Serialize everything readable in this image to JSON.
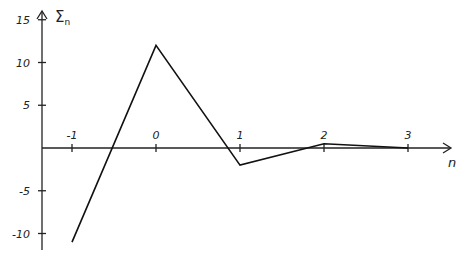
{
  "chart_data": {
    "type": "line",
    "title": "",
    "xlabel": "n",
    "ylabel": "Σ_n",
    "x": [
      -1,
      0,
      1,
      2,
      3
    ],
    "series": [
      {
        "name": "Σ_n",
        "values": [
          -11,
          12,
          -2,
          0.5,
          0
        ]
      }
    ],
    "x_ticks": [
      "-1",
      "0",
      "1",
      "2",
      "3"
    ],
    "y_ticks": [
      "15",
      "10",
      "5",
      "-5",
      "-10"
    ],
    "xlim": [
      -1.4,
      3.7
    ],
    "ylim": [
      -11.5,
      16.5
    ],
    "grid": false,
    "legend": "none"
  },
  "labels": {
    "y_axis_symbol": "Σ",
    "y_axis_subscript": "n",
    "x_axis": "n"
  }
}
